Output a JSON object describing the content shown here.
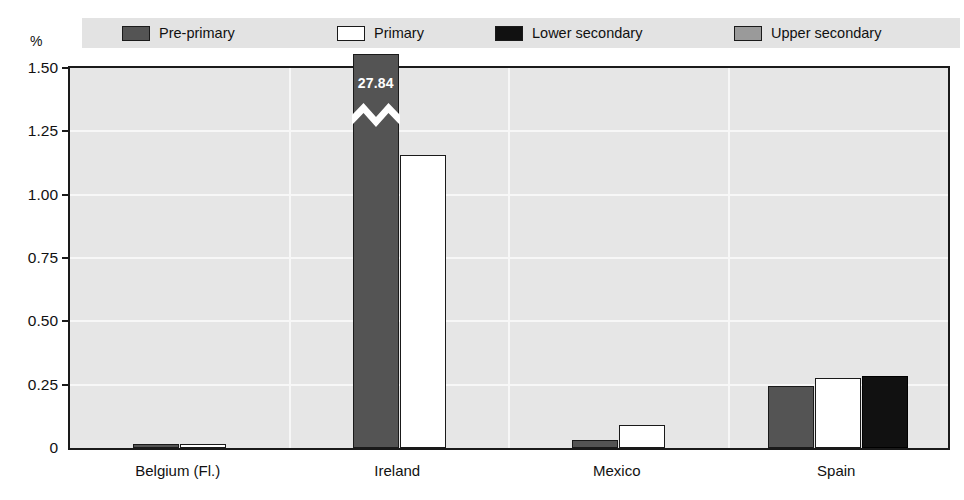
{
  "chart_data": {
    "type": "bar",
    "title": "",
    "subtitle": "",
    "xlabel": "",
    "ylabel": "%",
    "ylim": [
      0,
      1.5
    ],
    "grid": true,
    "legend_position": "top",
    "ytick_labels": [
      "0",
      "0.25",
      "0.50",
      "0.75",
      "1.00",
      "1.25",
      "1.50"
    ],
    "ytick_values": [
      0,
      0.25,
      0.5,
      0.75,
      1.0,
      1.25,
      1.5
    ],
    "categories": [
      "Belgium (Fl.)",
      "Ireland",
      "Mexico",
      "Spain"
    ],
    "series": [
      {
        "name": "Pre-primary",
        "color": "#545454",
        "values": [
          0.015,
          27.84,
          0.03,
          0.245
        ],
        "broken_axis_points": [
          {
            "category": "Ireland",
            "label": "27.84",
            "note": "bar truncated with zigzag break; true value 27.84 exceeds axis maximum 1.50"
          }
        ]
      },
      {
        "name": "Primary",
        "color": "#ffffff",
        "values": [
          0.015,
          1.155,
          0.09,
          0.275
        ]
      },
      {
        "name": "Lower secondary",
        "color": "#111111",
        "values": [
          null,
          null,
          null,
          0.285
        ]
      },
      {
        "name": "Upper secondary",
        "color": "#9a9a9a",
        "values": [
          null,
          null,
          null,
          null
        ]
      }
    ]
  },
  "legend": {
    "items": [
      {
        "label": "Pre-primary",
        "swatch": "#545454",
        "x": 40
      },
      {
        "label": "Primary",
        "swatch": "#ffffff",
        "x": 255
      },
      {
        "label": "Lower secondary",
        "swatch": "#111111",
        "x": 413
      },
      {
        "label": "Upper secondary",
        "swatch": "#9a9a9a",
        "x": 652
      }
    ]
  },
  "axes": {
    "y_unit": "%"
  }
}
